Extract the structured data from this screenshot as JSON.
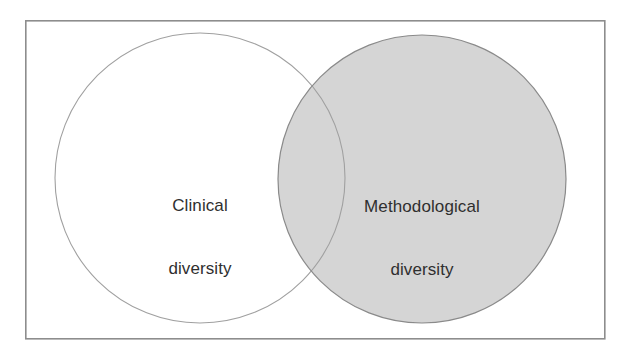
{
  "figure": {
    "type": "venn-diagram",
    "background_color": "#ffffff",
    "frame": {
      "name": "outer-frame",
      "x": 25,
      "y": 20,
      "width": 579,
      "height": 318,
      "stroke_color": "#8d8d8d",
      "stroke_width": 1.6,
      "fill": "none"
    },
    "sets": [
      {
        "id": "clinical",
        "label_lines": [
          "Clinical",
          "diversity"
        ],
        "label_text": "Clinical diversity",
        "cx": 200,
        "cy": 178,
        "r": 145,
        "fill": "none",
        "fill_color": "#ffffff",
        "stroke_color": "#a0a0a0",
        "stroke_width": 1.1
      },
      {
        "id": "methodological",
        "label_lines": [
          "Methodological",
          "diversity"
        ],
        "label_text": "Methodological diversity",
        "cx": 422,
        "cy": 179,
        "r": 144,
        "fill": "#d5d5d5",
        "fill_color": "#d5d5d5",
        "stroke_color": "#8a8a8a",
        "stroke_width": 1.2
      }
    ],
    "overlap": {
      "id": "clinical-methodological-overlap",
      "fill_color": "#d5d5d5",
      "description": "lens-shaped intersection of the two circles, same gray as the right circle"
    },
    "text_color": "#2f2f2f"
  }
}
